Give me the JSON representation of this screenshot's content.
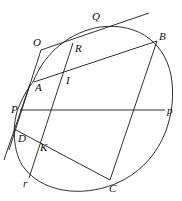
{
  "diagram": {
    "type": "conic-geometry",
    "points": [
      {
        "id": "O",
        "label": "O",
        "x": 41,
        "y": 50,
        "lx": 33,
        "ly": 46
      },
      {
        "id": "Q",
        "label": "Q",
        "x": 95,
        "y": 28,
        "lx": 92,
        "ly": 20
      },
      {
        "id": "R",
        "label": "R",
        "x": 73,
        "y": 43,
        "lx": 75,
        "ly": 52
      },
      {
        "id": "B",
        "label": "B",
        "x": 157,
        "y": 41,
        "lx": 159,
        "ly": 40
      },
      {
        "id": "A",
        "label": "A",
        "x": 34,
        "y": 82,
        "lx": 35,
        "ly": 91
      },
      {
        "id": "I",
        "label": "I",
        "x": 64,
        "y": 72,
        "lx": 66,
        "ly": 84
      },
      {
        "id": "P",
        "label": "P",
        "x": 21,
        "y": 110,
        "lx": 11,
        "ly": 113
      },
      {
        "id": "p",
        "label": "p",
        "x": 165,
        "y": 110,
        "lx": 167,
        "ly": 114
      },
      {
        "id": "D",
        "label": "D",
        "x": 17,
        "y": 129,
        "lx": 18,
        "ly": 142
      },
      {
        "id": "K",
        "label": "K",
        "x": 37,
        "y": 147,
        "lx": 40,
        "ly": 151
      },
      {
        "id": "C",
        "label": "C",
        "x": 110,
        "y": 180,
        "lx": 109,
        "ly": 192
      },
      {
        "id": "r",
        "label": "r",
        "x": 29,
        "y": 178,
        "lx": 23,
        "ly": 187
      }
    ],
    "labels": {
      "O": "O",
      "Q": "Q",
      "R": "R",
      "B": "B",
      "A": "A",
      "I": "I",
      "P": "P",
      "p": "p",
      "D": "D",
      "K": "K",
      "C": "C",
      "r": "r"
    }
  }
}
